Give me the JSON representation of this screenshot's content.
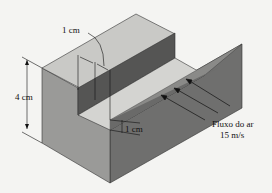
{
  "figure": {
    "type": "isometric-block-with-groove",
    "labels": {
      "groove_width": "1 cm",
      "block_height": "4 cm",
      "groove_depth": "1 cm",
      "flow_label_line1": "Fluxo do ar",
      "flow_label_line2": "15 m/s"
    },
    "colors": {
      "background": "#f4f4f2",
      "top_face": "#c9c9c6",
      "left_face": "#9a9a98",
      "right_face": "#6f6f6e",
      "groove_wall_dark": "#555554",
      "groove_floor": "#d4d4d1",
      "lines": "#222222"
    },
    "flow_arrow_count": 3
  }
}
